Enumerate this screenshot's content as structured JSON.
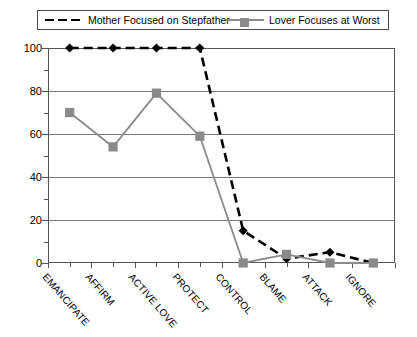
{
  "chart_data": {
    "type": "line",
    "title": "",
    "xlabel": "",
    "ylabel": "",
    "ylim": [
      0,
      100
    ],
    "yticks": [
      0,
      20,
      40,
      60,
      80,
      100
    ],
    "grid": true,
    "legend_position": "top",
    "categories": [
      "EMANCIPATE",
      "AFFIRM",
      "ACTIVE LOVE",
      "PROTECT",
      "CONTROL",
      "BLAME",
      "ATTACK",
      "IGNORE"
    ],
    "series": [
      {
        "name": "Mother Focused on Stepfather",
        "color": "#000000",
        "marker": "diamond",
        "linestyle": "dashed",
        "values": [
          100,
          100,
          100,
          100,
          15,
          2,
          5,
          0
        ]
      },
      {
        "name": "Lover Focuses at Worst",
        "color": "#8a8a8a",
        "marker": "square",
        "linestyle": "solid",
        "values": [
          70,
          54,
          79,
          59,
          0,
          4,
          0,
          0
        ]
      }
    ]
  },
  "legend": {
    "entries": [
      {
        "label": "Mother Focused on Stepfather"
      },
      {
        "label": "Lover Focuses at Worst"
      }
    ]
  }
}
